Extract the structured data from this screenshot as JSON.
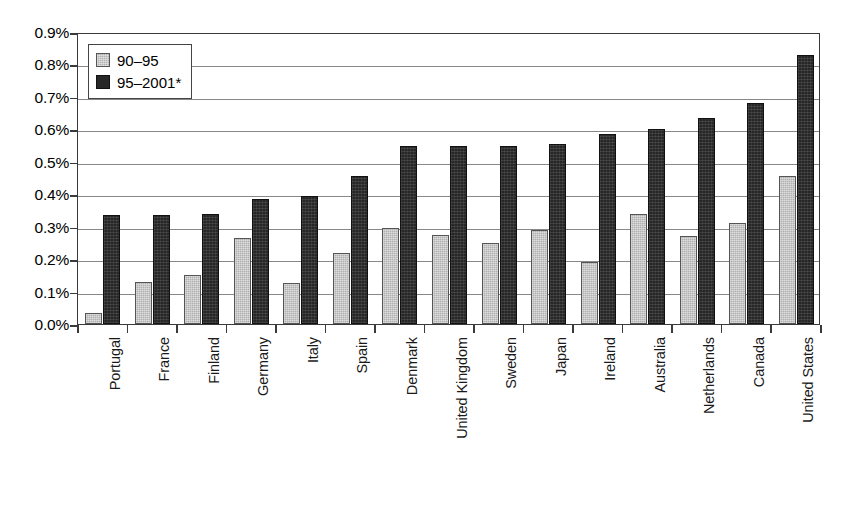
{
  "chart_data": {
    "type": "bar",
    "title": "",
    "subtitle": "",
    "xlabel": "",
    "ylabel": "",
    "ylim": [
      0.0,
      0.9
    ],
    "ytick_labels": [
      "0.9%",
      "0.8%",
      "0.7%",
      "0.6%",
      "0.5%",
      "0.4%",
      "0.3%",
      "0.2%",
      "0.1%",
      "0.0%"
    ],
    "ytick_values": [
      0.9,
      0.8,
      0.7,
      0.6,
      0.5,
      0.4,
      0.3,
      0.2,
      0.1,
      0.0
    ],
    "grid": true,
    "legend_position": "top-left",
    "value_unit": "%",
    "categories": [
      "Portugal",
      "France",
      "Finland",
      "Germany",
      "Italy",
      "Spain",
      "Denmark",
      "United Kingdom",
      "Sweden",
      "Japan",
      "Ireland",
      "Australia",
      "Netherlands",
      "Canada",
      "United States"
    ],
    "series": [
      {
        "name": "90–95",
        "color": "#b0b0b0",
        "values": [
          0.035,
          0.13,
          0.15,
          0.265,
          0.125,
          0.22,
          0.295,
          0.275,
          0.25,
          0.29,
          0.19,
          0.34,
          0.27,
          0.31,
          0.455
        ]
      },
      {
        "name": "95–2001*",
        "color": "#272727",
        "values": [
          0.335,
          0.335,
          0.34,
          0.385,
          0.395,
          0.455,
          0.55,
          0.55,
          0.55,
          0.555,
          0.585,
          0.6,
          0.635,
          0.68,
          0.83
        ]
      }
    ]
  },
  "legend": {
    "items": [
      {
        "label": "90–95",
        "swatch": "light"
      },
      {
        "label": "95–2001*",
        "swatch": "dark"
      }
    ]
  },
  "footnote": {
    "text": ""
  }
}
